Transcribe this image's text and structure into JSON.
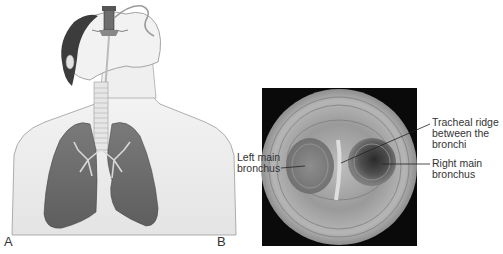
{
  "figure": {
    "panels": [
      {
        "letter": "A",
        "description": "Illustration of person with endotracheal tube, trachea and lungs"
      },
      {
        "letter": "B",
        "description": "Bronchoscopic view of tracheal carina"
      }
    ],
    "labels": {
      "left_main_bronchus": [
        "Left main",
        "bronchus"
      ],
      "tracheal_ridge": [
        "Tracheal ridge",
        "between the",
        "bronchi"
      ],
      "right_main_bronchus": [
        "Right main",
        "bronchus"
      ]
    },
    "colors": {
      "background": "#ffffff",
      "scope_frame": "#0a0a0a",
      "lung": "#6f6f6f",
      "skin_line": "#8a8a8a"
    }
  }
}
